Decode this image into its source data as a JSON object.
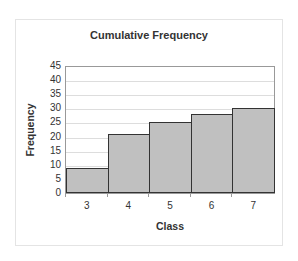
{
  "chart_data": {
    "type": "bar",
    "title": "Cumulative Frequency",
    "xlabel": "Class",
    "ylabel": "Frequency",
    "categories": [
      "3",
      "4",
      "5",
      "6",
      "7"
    ],
    "values": [
      9,
      21,
      25,
      28,
      30
    ],
    "ylim": [
      0,
      45
    ],
    "yticks": [
      "0",
      "5",
      "10",
      "15",
      "20",
      "25",
      "30",
      "35",
      "40",
      "45"
    ],
    "grid": true,
    "legend": null,
    "bar_gap": 0,
    "colors": {
      "bar_fill": "#c0c0c0",
      "bar_border": "#333333",
      "grid": "#dddddd"
    }
  }
}
